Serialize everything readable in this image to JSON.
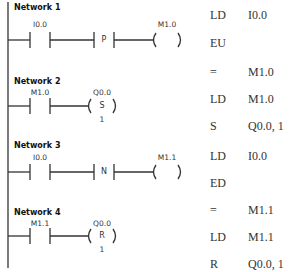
{
  "ladder": {
    "networks": [
      {
        "label": "Network 1",
        "contact_address": "I0.0",
        "edge_box": "P",
        "coil_address": "M1.0",
        "coil_type": ""
      },
      {
        "label": "Network 2",
        "contact_address": "M1.0",
        "coil_address": "Q0.0",
        "coil_type": "S",
        "coil_count": "1"
      },
      {
        "label": "Network 3",
        "contact_address": "I0.0",
        "edge_box": "N",
        "coil_address": "M1.1",
        "coil_type": ""
      },
      {
        "label": "Network 4",
        "contact_address": "M1.1",
        "coil_address": "Q0.0",
        "coil_type": "R",
        "coil_count": "1"
      }
    ]
  },
  "stl": {
    "lines": [
      {
        "op": "LD",
        "operand": "I0.0"
      },
      {
        "op": "EU",
        "operand": ""
      },
      {
        "op": "=",
        "operand": "M1.0"
      },
      {
        "op": "LD",
        "operand": "M1.0"
      },
      {
        "op": "S",
        "operand": "Q0.0, 1"
      },
      {
        "op": "LD",
        "operand": "I0.0"
      },
      {
        "op": "ED",
        "operand": ""
      },
      {
        "op": "=",
        "operand": "M1.1"
      },
      {
        "op": "LD",
        "operand": "M1.1"
      },
      {
        "op": "R",
        "operand": "Q0.0, 1"
      }
    ]
  },
  "colors": {
    "line": "#333333",
    "background": "#ffffff"
  }
}
